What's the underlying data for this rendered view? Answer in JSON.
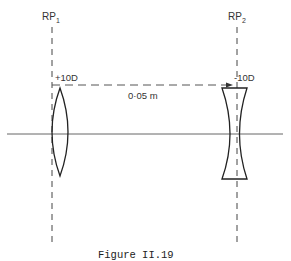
{
  "figure": {
    "caption": "Figure II.19"
  },
  "reference_planes": [
    {
      "label": "RP",
      "subscript": "1"
    },
    {
      "label": "RP",
      "subscript": "2"
    }
  ],
  "lenses": [
    {
      "type": "convex",
      "power_label": "+10D"
    },
    {
      "type": "concave",
      "power_label": "-10D"
    }
  ],
  "separation": {
    "label": "0·05 m"
  },
  "colors": {
    "line": "#2a2a2a",
    "axis": "#555555",
    "dash": "#444444"
  }
}
